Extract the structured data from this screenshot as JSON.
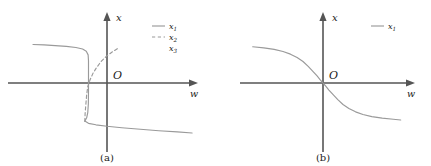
{
  "figure": {
    "background_color": "#ffffff",
    "axis_color": "#555555",
    "curve_color": "#9a9a9a",
    "text_color": "#1a1a1a"
  },
  "panels": [
    {
      "id": "a",
      "caption": "(a)",
      "xlabel": "w",
      "ylabel": "x",
      "origin_label": "O",
      "legend": [
        {
          "label": "x",
          "subscript": "1",
          "style": "solid"
        },
        {
          "label": "x",
          "subscript": "2",
          "style": "dashed"
        },
        {
          "label": "x",
          "subscript": "3",
          "style": "none"
        }
      ]
    },
    {
      "id": "b",
      "caption": "(b)",
      "xlabel": "w",
      "ylabel": "x",
      "origin_label": "O",
      "legend": [
        {
          "label": "x",
          "subscript": "1",
          "style": "solid"
        }
      ]
    }
  ],
  "chart_data": {
    "type": "line",
    "title": "",
    "xlabel": "w",
    "ylabel": "x",
    "grid": false,
    "legend_position": "top-right",
    "panels": [
      {
        "id": "a",
        "caption": "(a)",
        "description": "S-shaped hysteresis / bistable response: upper stable branch, dashed unstable middle branch, lower stable branch",
        "xlim": [
          -1.0,
          1.25
        ],
        "ylim": [
          -1.0,
          1.0
        ],
        "series": [
          {
            "name": "x1",
            "style": "solid",
            "description": "upper stable branch, nearly flat then turning down at the fold",
            "points": [
              [
                -1.0,
                0.52
              ],
              [
                -0.85,
                0.515
              ],
              [
                -0.7,
                0.505
              ],
              [
                -0.55,
                0.495
              ],
              [
                -0.42,
                0.48
              ],
              [
                -0.33,
                0.46
              ],
              [
                -0.28,
                0.43
              ],
              [
                -0.255,
                0.38
              ],
              [
                -0.25,
                0.3
              ],
              [
                -0.25,
                0.1
              ],
              [
                -0.25,
                -0.1
              ],
              [
                -0.252,
                -0.28
              ],
              [
                -0.26,
                -0.4
              ],
              [
                -0.275,
                -0.47
              ],
              [
                -0.3,
                -0.515
              ],
              [
                -0.25,
                -0.545
              ],
              [
                -0.15,
                -0.565
              ],
              [
                0.0,
                -0.585
              ],
              [
                0.2,
                -0.605
              ],
              [
                0.45,
                -0.625
              ],
              [
                0.7,
                -0.645
              ],
              [
                0.95,
                -0.66
              ],
              [
                1.15,
                -0.675
              ]
            ]
          },
          {
            "name": "x2",
            "style": "dashed",
            "description": "unstable middle branch rising through the origin region",
            "points": [
              [
                -0.3,
                -0.52
              ],
              [
                -0.295,
                -0.4
              ],
              [
                -0.285,
                -0.28
              ],
              [
                -0.275,
                -0.16
              ],
              [
                -0.26,
                -0.05
              ],
              [
                -0.23,
                0.04
              ],
              [
                -0.19,
                0.13
              ],
              [
                -0.14,
                0.21
              ],
              [
                -0.08,
                0.29
              ],
              [
                -0.01,
                0.36
              ],
              [
                0.07,
                0.42
              ],
              [
                0.15,
                0.47
              ]
            ]
          },
          {
            "name": "x3",
            "style": "none",
            "description": "third branch, legend entry only"
          }
        ]
      },
      {
        "id": "b",
        "caption": "(b)",
        "description": "Single-valued smooth monotonically decreasing S-curve through the origin",
        "xlim": [
          -1.0,
          1.25
        ],
        "ylim": [
          -1.0,
          1.0
        ],
        "series": [
          {
            "name": "x1",
            "style": "solid",
            "points": [
              [
                -0.95,
                0.49
              ],
              [
                -0.8,
                0.475
              ],
              [
                -0.66,
                0.455
              ],
              [
                -0.54,
                0.425
              ],
              [
                -0.44,
                0.39
              ],
              [
                -0.35,
                0.345
              ],
              [
                -0.27,
                0.29
              ],
              [
                -0.2,
                0.225
              ],
              [
                -0.14,
                0.16
              ],
              [
                -0.08,
                0.095
              ],
              [
                -0.04,
                0.045
              ],
              [
                0.0,
                0.0
              ],
              [
                0.04,
                -0.045
              ],
              [
                0.08,
                -0.095
              ],
              [
                0.14,
                -0.16
              ],
              [
                0.2,
                -0.225
              ],
              [
                0.27,
                -0.29
              ],
              [
                0.35,
                -0.345
              ],
              [
                0.44,
                -0.39
              ],
              [
                0.54,
                -0.425
              ],
              [
                0.66,
                -0.455
              ],
              [
                0.8,
                -0.475
              ],
              [
                0.95,
                -0.49
              ],
              [
                1.05,
                -0.5
              ]
            ]
          }
        ]
      }
    ]
  }
}
